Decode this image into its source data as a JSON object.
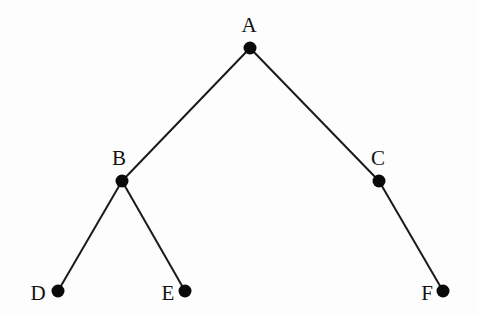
{
  "diagram": {
    "type": "tree",
    "nodes": [
      {
        "id": "A",
        "label": "A",
        "x": 250,
        "y": 48,
        "lx": 249,
        "ly": 32,
        "anchor": "middle"
      },
      {
        "id": "B",
        "label": "B",
        "x": 122,
        "y": 181,
        "lx": 119,
        "ly": 165,
        "anchor": "middle"
      },
      {
        "id": "C",
        "label": "C",
        "x": 379,
        "y": 181,
        "lx": 378,
        "ly": 165,
        "anchor": "middle"
      },
      {
        "id": "D",
        "label": "D",
        "x": 58,
        "y": 291,
        "lx": 38,
        "ly": 300,
        "anchor": "middle"
      },
      {
        "id": "E",
        "label": "E",
        "x": 185,
        "y": 291,
        "lx": 168,
        "ly": 300,
        "anchor": "middle"
      },
      {
        "id": "F",
        "label": "F",
        "x": 443,
        "y": 291,
        "lx": 427,
        "ly": 300,
        "anchor": "middle"
      }
    ],
    "edges": [
      {
        "from": "A",
        "to": "B"
      },
      {
        "from": "A",
        "to": "C"
      },
      {
        "from": "B",
        "to": "D"
      },
      {
        "from": "B",
        "to": "E"
      },
      {
        "from": "C",
        "to": "F"
      }
    ],
    "colors": {
      "edge": "#1a1a1a",
      "node": "#0a0a0a",
      "label": "#111111",
      "background": "#fdfdfd"
    }
  }
}
